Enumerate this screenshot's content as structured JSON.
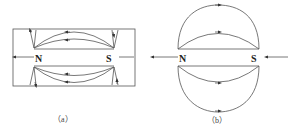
{
  "figure_a": {
    "caption": "（a）",
    "north_label": "N",
    "south_label": "S",
    "description": "Bar magnet inside rectangular frame with field lines curving from N to S; arrows point toward N along curves (inner) and vertical arrows at poles"
  },
  "figure_b": {
    "caption": "（b）",
    "north_label": "N",
    "south_label": "S",
    "description": "Bar magnet with oval field lines looping from N around to S; arrows on loops pointing from S side to N side (reversed), horizontal arrows at ends"
  },
  "colors": {
    "line": "#555555",
    "text": "#222222",
    "background": "#ffffff"
  }
}
